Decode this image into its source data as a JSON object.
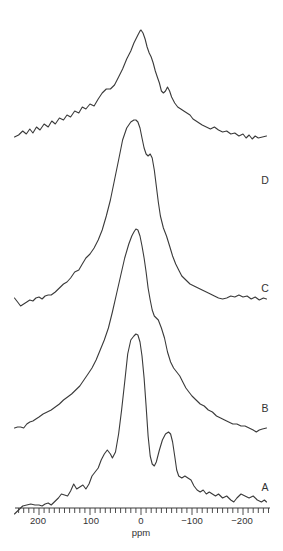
{
  "chart_data": {
    "type": "line",
    "title": "",
    "xlabel": "ppm",
    "ylabel": "",
    "xlim": [
      250,
      -250
    ],
    "x_reversed": true,
    "grid": false,
    "legend": "inline labels at right end of each trace",
    "x_ticks": [
      200,
      100,
      0,
      -100,
      -200
    ],
    "x_tick_labels": [
      "200",
      "100",
      "0",
      "−100",
      "−200"
    ],
    "minor_tick_step": 10,
    "series": [
      {
        "name": "D",
        "baseline_px": 137,
        "points": [
          [
            248,
            0
          ],
          [
            240,
            2
          ],
          [
            232,
            6
          ],
          [
            225,
            3
          ],
          [
            218,
            8
          ],
          [
            212,
            4
          ],
          [
            205,
            10
          ],
          [
            198,
            7
          ],
          [
            190,
            13
          ],
          [
            182,
            10
          ],
          [
            175,
            16
          ],
          [
            168,
            13
          ],
          [
            160,
            19
          ],
          [
            152,
            17
          ],
          [
            145,
            22
          ],
          [
            138,
            20
          ],
          [
            130,
            26
          ],
          [
            122,
            24
          ],
          [
            115,
            30
          ],
          [
            108,
            28
          ],
          [
            100,
            33
          ],
          [
            92,
            31
          ],
          [
            84,
            38
          ],
          [
            76,
            44
          ],
          [
            68,
            48
          ],
          [
            60,
            48
          ],
          [
            52,
            52
          ],
          [
            44,
            60
          ],
          [
            36,
            68
          ],
          [
            28,
            78
          ],
          [
            20,
            86
          ],
          [
            14,
            94
          ],
          [
            10,
            98
          ],
          [
            6,
            102
          ],
          [
            2,
            106
          ],
          [
            0,
            107
          ],
          [
            -4,
            104
          ],
          [
            -8,
            98
          ],
          [
            -12,
            90
          ],
          [
            -16,
            84
          ],
          [
            -20,
            80
          ],
          [
            -24,
            74
          ],
          [
            -28,
            66
          ],
          [
            -32,
            60
          ],
          [
            -36,
            54
          ],
          [
            -40,
            46
          ],
          [
            -44,
            44
          ],
          [
            -48,
            46
          ],
          [
            -52,
            50
          ],
          [
            -56,
            46
          ],
          [
            -60,
            40
          ],
          [
            -66,
            34
          ],
          [
            -72,
            30
          ],
          [
            -78,
            28
          ],
          [
            -84,
            26
          ],
          [
            -90,
            24
          ],
          [
            -96,
            22
          ],
          [
            -102,
            18
          ],
          [
            -108,
            16
          ],
          [
            -114,
            14
          ],
          [
            -120,
            12
          ],
          [
            -128,
            10
          ],
          [
            -136,
            8
          ],
          [
            -144,
            10
          ],
          [
            -152,
            7
          ],
          [
            -160,
            5
          ],
          [
            -168,
            6
          ],
          [
            -176,
            3
          ],
          [
            -184,
            4
          ],
          [
            -192,
            1
          ],
          [
            -200,
            3
          ],
          [
            -206,
            -1
          ],
          [
            -212,
            2
          ],
          [
            -218,
            -2
          ],
          [
            -224,
            1
          ],
          [
            -230,
            -1
          ],
          [
            -238,
            0
          ],
          [
            -246,
            1
          ]
        ]
      },
      {
        "name": "C",
        "baseline_px": 298,
        "points": [
          [
            248,
            0
          ],
          [
            242,
            -4
          ],
          [
            236,
            -8
          ],
          [
            230,
            -6
          ],
          [
            224,
            -4
          ],
          [
            218,
            -2
          ],
          [
            212,
            -3
          ],
          [
            206,
            0
          ],
          [
            200,
            1
          ],
          [
            194,
            -1
          ],
          [
            188,
            2
          ],
          [
            182,
            3
          ],
          [
            176,
            3
          ],
          [
            168,
            6
          ],
          [
            160,
            10
          ],
          [
            152,
            14
          ],
          [
            145,
            16
          ],
          [
            138,
            20
          ],
          [
            130,
            26
          ],
          [
            122,
            28
          ],
          [
            115,
            34
          ],
          [
            108,
            40
          ],
          [
            100,
            44
          ],
          [
            92,
            50
          ],
          [
            84,
            58
          ],
          [
            76,
            68
          ],
          [
            68,
            82
          ],
          [
            60,
            98
          ],
          [
            52,
            118
          ],
          [
            44,
            138
          ],
          [
            36,
            158
          ],
          [
            28,
            170
          ],
          [
            20,
            176
          ],
          [
            14,
            178
          ],
          [
            10,
            178
          ],
          [
            6,
            176
          ],
          [
            2,
            170
          ],
          [
            -2,
            160
          ],
          [
            -6,
            150
          ],
          [
            -10,
            144
          ],
          [
            -14,
            142
          ],
          [
            -18,
            144
          ],
          [
            -22,
            140
          ],
          [
            -26,
            128
          ],
          [
            -30,
            112
          ],
          [
            -34,
            96
          ],
          [
            -38,
            82
          ],
          [
            -44,
            70
          ],
          [
            -50,
            62
          ],
          [
            -56,
            52
          ],
          [
            -62,
            42
          ],
          [
            -68,
            34
          ],
          [
            -74,
            28
          ],
          [
            -80,
            22
          ],
          [
            -88,
            18
          ],
          [
            -96,
            14
          ],
          [
            -104,
            12
          ],
          [
            -112,
            10
          ],
          [
            -120,
            8
          ],
          [
            -128,
            6
          ],
          [
            -136,
            4
          ],
          [
            -144,
            2
          ],
          [
            -152,
            0
          ],
          [
            -160,
            -1
          ],
          [
            -168,
            0
          ],
          [
            -176,
            2
          ],
          [
            -184,
            1
          ],
          [
            -192,
            3
          ],
          [
            -200,
            1
          ],
          [
            -208,
            2
          ],
          [
            -216,
            -1
          ],
          [
            -224,
            1
          ],
          [
            -232,
            -2
          ],
          [
            -240,
            0
          ],
          [
            -246,
            -1
          ]
        ]
      },
      {
        "name": "B",
        "baseline_px": 428,
        "points": [
          [
            248,
            0
          ],
          [
            242,
            1
          ],
          [
            236,
            1
          ],
          [
            230,
            0
          ],
          [
            224,
            4
          ],
          [
            218,
            6
          ],
          [
            212,
            7
          ],
          [
            206,
            9
          ],
          [
            200,
            11
          ],
          [
            192,
            14
          ],
          [
            184,
            16
          ],
          [
            176,
            18
          ],
          [
            168,
            21
          ],
          [
            160,
            24
          ],
          [
            152,
            28
          ],
          [
            144,
            31
          ],
          [
            136,
            34
          ],
          [
            128,
            38
          ],
          [
            120,
            42
          ],
          [
            112,
            48
          ],
          [
            104,
            54
          ],
          [
            96,
            60
          ],
          [
            88,
            68
          ],
          [
            80,
            78
          ],
          [
            72,
            88
          ],
          [
            64,
            100
          ],
          [
            56,
            116
          ],
          [
            48,
            134
          ],
          [
            40,
            152
          ],
          [
            32,
            170
          ],
          [
            24,
            184
          ],
          [
            18,
            192
          ],
          [
            14,
            196
          ],
          [
            10,
            199
          ],
          [
            6,
            198
          ],
          [
            2,
            192
          ],
          [
            -2,
            182
          ],
          [
            -6,
            170
          ],
          [
            -10,
            156
          ],
          [
            -14,
            140
          ],
          [
            -18,
            128
          ],
          [
            -22,
            118
          ],
          [
            -26,
            112
          ],
          [
            -30,
            110
          ],
          [
            -34,
            108
          ],
          [
            -40,
            100
          ],
          [
            -46,
            90
          ],
          [
            -52,
            76
          ],
          [
            -58,
            66
          ],
          [
            -64,
            60
          ],
          [
            -70,
            56
          ],
          [
            -76,
            52
          ],
          [
            -82,
            46
          ],
          [
            -88,
            40
          ],
          [
            -94,
            36
          ],
          [
            -100,
            32
          ],
          [
            -108,
            28
          ],
          [
            -116,
            24
          ],
          [
            -124,
            22
          ],
          [
            -132,
            18
          ],
          [
            -140,
            16
          ],
          [
            -148,
            12
          ],
          [
            -156,
            10
          ],
          [
            -164,
            8
          ],
          [
            -172,
            6
          ],
          [
            -180,
            4
          ],
          [
            -188,
            4
          ],
          [
            -196,
            2
          ],
          [
            -204,
            2
          ],
          [
            -212,
            0
          ],
          [
            -220,
            -2
          ],
          [
            -226,
            -4
          ],
          [
            -232,
            -2
          ],
          [
            -238,
            -1
          ],
          [
            -246,
            0
          ]
        ]
      },
      {
        "name": "A",
        "baseline_px": 506,
        "points": [
          [
            248,
            -8
          ],
          [
            240,
            -4
          ],
          [
            232,
            0
          ],
          [
            224,
            1
          ],
          [
            216,
            2
          ],
          [
            208,
            1
          ],
          [
            200,
            1
          ],
          [
            194,
            0
          ],
          [
            188,
            2
          ],
          [
            182,
            3
          ],
          [
            176,
            1
          ],
          [
            170,
            4
          ],
          [
            162,
            8
          ],
          [
            156,
            12
          ],
          [
            150,
            11
          ],
          [
            144,
            10
          ],
          [
            138,
            15
          ],
          [
            132,
            22
          ],
          [
            126,
            17
          ],
          [
            120,
            19
          ],
          [
            114,
            21
          ],
          [
            108,
            17
          ],
          [
            102,
            22
          ],
          [
            96,
            30
          ],
          [
            90,
            34
          ],
          [
            84,
            38
          ],
          [
            78,
            46
          ],
          [
            72,
            52
          ],
          [
            66,
            56
          ],
          [
            60,
            52
          ],
          [
            56,
            48
          ],
          [
            50,
            54
          ],
          [
            44,
            72
          ],
          [
            38,
            96
          ],
          [
            32,
            124
          ],
          [
            26,
            152
          ],
          [
            20,
            166
          ],
          [
            14,
            170
          ],
          [
            10,
            172
          ],
          [
            6,
            171
          ],
          [
            2,
            164
          ],
          [
            -2,
            150
          ],
          [
            -6,
            128
          ],
          [
            -10,
            100
          ],
          [
            -14,
            70
          ],
          [
            -18,
            50
          ],
          [
            -22,
            42
          ],
          [
            -26,
            40
          ],
          [
            -30,
            44
          ],
          [
            -36,
            56
          ],
          [
            -42,
            66
          ],
          [
            -48,
            72
          ],
          [
            -54,
            74
          ],
          [
            -58,
            72
          ],
          [
            -62,
            64
          ],
          [
            -66,
            50
          ],
          [
            -70,
            36
          ],
          [
            -74,
            30
          ],
          [
            -80,
            28
          ],
          [
            -86,
            30
          ],
          [
            -92,
            28
          ],
          [
            -98,
            26
          ],
          [
            -104,
            20
          ],
          [
            -110,
            16
          ],
          [
            -116,
            14
          ],
          [
            -122,
            16
          ],
          [
            -128,
            12
          ],
          [
            -134,
            14
          ],
          [
            -140,
            12
          ],
          [
            -146,
            10
          ],
          [
            -152,
            12
          ],
          [
            -160,
            8
          ],
          [
            -168,
            10
          ],
          [
            -176,
            6
          ],
          [
            -182,
            4
          ],
          [
            -188,
            8
          ],
          [
            -196,
            12
          ],
          [
            -204,
            10
          ],
          [
            -212,
            8
          ],
          [
            -220,
            10
          ],
          [
            -228,
            6
          ],
          [
            -236,
            4
          ],
          [
            -242,
            6
          ],
          [
            -246,
            4
          ]
        ]
      }
    ],
    "annotations": [
      "A",
      "B",
      "C",
      "D"
    ]
  },
  "axis": {
    "title": "ppm",
    "labels": [
      "200",
      "100",
      "0",
      "−100",
      "−200"
    ]
  },
  "trace_labels": {
    "A": "A",
    "B": "B",
    "C": "C",
    "D": "D"
  }
}
